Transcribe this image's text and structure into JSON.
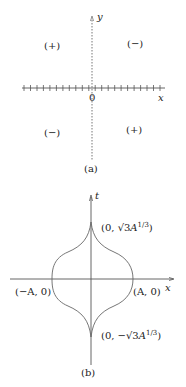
{
  "figure_a": {
    "caption": "(a)",
    "x_axis_label": "x",
    "y_axis_label": "y",
    "origin_label": "0",
    "tick_count": 22,
    "quadrants": {
      "upper_left": "(+)",
      "upper_right": "(−)",
      "lower_left": "(−)",
      "lower_right": "(+)"
    }
  },
  "figure_b": {
    "caption": "(b)",
    "x_axis_label": "x",
    "t_axis_label": "t",
    "points": {
      "top": {
        "prefix": "(0, ",
        "sqrt": "√3",
        "var": "A",
        "exp": "1/3",
        "suffix": ")"
      },
      "bottom": {
        "prefix": "(0, −",
        "sqrt": "√3",
        "var": "A",
        "exp": "1/3",
        "suffix": ")"
      },
      "left": "(−A, 0)",
      "right": "(A, 0)"
    }
  },
  "colors": {
    "axis": "#555555",
    "curve": "#666666",
    "text": "#222222"
  }
}
